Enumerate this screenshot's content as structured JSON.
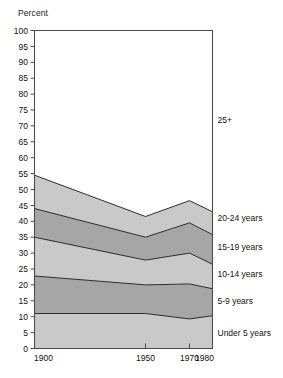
{
  "chart_data": {
    "type": "area",
    "subtype": "stacked-percentage-area",
    "title": "",
    "xlabel": "",
    "ylabel": "Percent",
    "ylim": [
      0,
      100
    ],
    "xlim": [
      1900,
      1980
    ],
    "grid": false,
    "legend_position": "right-inline",
    "y_ticks": [
      0,
      5,
      10,
      15,
      20,
      25,
      30,
      35,
      40,
      45,
      50,
      55,
      60,
      65,
      70,
      75,
      80,
      85,
      90,
      95,
      100
    ],
    "x_ticks": [
      1900,
      1950,
      1970,
      1980
    ],
    "x_tick_labels": [
      "1900",
      "1950",
      "1970",
      "1980"
    ],
    "x": [
      1900,
      1950,
      1970,
      1980
    ],
    "series": [
      {
        "name": "Under 5 years",
        "label": "Under 5 years",
        "color": "#c9c9c9",
        "values": [
          11.0,
          11.0,
          9.3,
          10.3
        ]
      },
      {
        "name": "5-9 years",
        "label": "5-9 years",
        "color": "#a6a6a6",
        "values": [
          11.8,
          9.0,
          11.0,
          8.5
        ]
      },
      {
        "name": "10-14 years",
        "label": "10-14 years",
        "color": "#c9c9c9",
        "values": [
          12.2,
          7.8,
          9.7,
          7.7
        ]
      },
      {
        "name": "15-19 years",
        "label": "15-19 years",
        "color": "#a6a6a6",
        "values": [
          9.0,
          7.2,
          9.5,
          9.3
        ]
      },
      {
        "name": "20-24 years",
        "label": "20-24 years",
        "color": "#c9c9c9",
        "values": [
          10.5,
          6.5,
          7.0,
          7.2
        ]
      },
      {
        "name": "25+",
        "label": "25+",
        "color": "#ffffff",
        "values": [
          45.5,
          58.5,
          53.5,
          57.0
        ]
      }
    ],
    "cumulative_boundaries": {
      "under5_top": [
        11.0,
        11.0,
        9.3,
        10.3
      ],
      "age5_9_top": [
        22.8,
        20.0,
        20.3,
        18.8
      ],
      "age10_14_top": [
        35.0,
        27.8,
        30.0,
        26.5
      ],
      "age15_19_top": [
        44.0,
        35.0,
        39.5,
        35.8
      ],
      "age20_24_top": [
        54.5,
        41.5,
        46.5,
        43.0
      ],
      "total_top": [
        100,
        100,
        100,
        100
      ]
    },
    "series_label_positions": {
      "25+": 72,
      "20-24 years": 41,
      "15-19 years": 32,
      "10-14 years": 23.5,
      "5-9 years": 15,
      "Under 5 years": 5
    }
  }
}
